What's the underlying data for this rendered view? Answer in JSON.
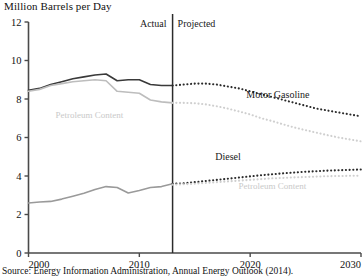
{
  "chart_data": {
    "type": "line",
    "title": "Million Barrels per Day",
    "xlabel": "",
    "ylabel": "Million Barrels per Day",
    "xlim": [
      2000,
      2030
    ],
    "ylim": [
      0,
      12
    ],
    "yticks": [
      0,
      2,
      4,
      6,
      8,
      10,
      12
    ],
    "xticks": [
      2000,
      2010,
      2020,
      2030
    ],
    "grid": false,
    "legend": "inline-annotations",
    "divider_year": 2013,
    "period_labels": {
      "actual": "Actual",
      "projected": "Projected"
    },
    "annotations": [
      {
        "text": "Motor Gasoline",
        "x": 2022.5,
        "y": 8.05,
        "color": "#2b2b2b"
      },
      {
        "text": "Petroleum Content",
        "x": 2005.5,
        "y": 7.0,
        "color": "#c9c9c9"
      },
      {
        "text": "Diesel",
        "x": 2018.0,
        "y": 4.85,
        "color": "#2b2b2b"
      },
      {
        "text": "Petroleum Content",
        "x": 2022.0,
        "y": 3.35,
        "color": "#c9c9c9"
      }
    ],
    "series": [
      {
        "name": "Motor Gasoline",
        "style": "solid",
        "segment": "actual",
        "color": "#3a3a3a",
        "x": [
          2000,
          2001,
          2002,
          2003,
          2004,
          2005,
          2006,
          2007,
          2008,
          2009,
          2010,
          2011,
          2012,
          2013
        ],
        "values": [
          8.45,
          8.55,
          8.75,
          8.9,
          9.05,
          9.15,
          9.25,
          9.3,
          8.95,
          9.0,
          9.0,
          8.75,
          8.7,
          8.7
        ]
      },
      {
        "name": "Motor Gasoline Petroleum Content",
        "style": "solid",
        "segment": "actual",
        "color": "#bdbdbd",
        "x": [
          2000,
          2001,
          2002,
          2003,
          2004,
          2005,
          2006,
          2007,
          2008,
          2009,
          2010,
          2011,
          2012,
          2013
        ],
        "values": [
          8.4,
          8.5,
          8.7,
          8.8,
          8.9,
          8.95,
          9.0,
          8.95,
          8.4,
          8.35,
          8.3,
          7.95,
          7.85,
          7.8
        ]
      },
      {
        "name": "Motor Gasoline",
        "style": "dotted",
        "segment": "projected",
        "color": "#2b2b2b",
        "x": [
          2013,
          2014,
          2015,
          2016,
          2017,
          2018,
          2019,
          2020,
          2021,
          2022,
          2023,
          2024,
          2025,
          2026,
          2027,
          2028,
          2029,
          2030
        ],
        "values": [
          8.7,
          8.75,
          8.8,
          8.8,
          8.75,
          8.65,
          8.55,
          8.4,
          8.25,
          8.1,
          7.95,
          7.8,
          7.65,
          7.5,
          7.4,
          7.3,
          7.2,
          7.1
        ]
      },
      {
        "name": "Motor Gasoline Petroleum Content",
        "style": "dotted",
        "segment": "projected",
        "color": "#cfcfcf",
        "x": [
          2013,
          2014,
          2015,
          2016,
          2017,
          2018,
          2019,
          2020,
          2021,
          2022,
          2023,
          2024,
          2025,
          2026,
          2027,
          2028,
          2029,
          2030
        ],
        "values": [
          7.8,
          7.8,
          7.78,
          7.72,
          7.62,
          7.5,
          7.35,
          7.2,
          7.0,
          6.85,
          6.68,
          6.52,
          6.38,
          6.25,
          6.12,
          6.0,
          5.9,
          5.8
        ]
      },
      {
        "name": "Diesel",
        "style": "solid",
        "segment": "actual",
        "color": "#9a9a9a",
        "x": [
          2000,
          2001,
          2002,
          2003,
          2004,
          2005,
          2006,
          2007,
          2008,
          2009,
          2010,
          2011,
          2012,
          2013
        ],
        "values": [
          2.6,
          2.65,
          2.68,
          2.8,
          2.95,
          3.1,
          3.3,
          3.45,
          3.4,
          3.12,
          3.25,
          3.4,
          3.45,
          3.6
        ]
      },
      {
        "name": "Diesel",
        "style": "dotted",
        "segment": "projected",
        "color": "#2b2b2b",
        "x": [
          2013,
          2014,
          2015,
          2016,
          2017,
          2018,
          2019,
          2020,
          2021,
          2022,
          2023,
          2024,
          2025,
          2026,
          2027,
          2028,
          2029,
          2030
        ],
        "values": [
          3.6,
          3.62,
          3.68,
          3.74,
          3.8,
          3.86,
          3.92,
          3.98,
          4.04,
          4.09,
          4.14,
          4.18,
          4.22,
          4.25,
          4.28,
          4.3,
          4.32,
          4.34
        ]
      },
      {
        "name": "Diesel Petroleum Content",
        "style": "dotted",
        "segment": "projected",
        "color": "#cfcfcf",
        "x": [
          2013,
          2014,
          2015,
          2016,
          2017,
          2018,
          2019,
          2020,
          2021,
          2022,
          2023,
          2024,
          2025,
          2026,
          2027,
          2028,
          2029,
          2030
        ],
        "values": [
          3.55,
          3.57,
          3.6,
          3.64,
          3.68,
          3.72,
          3.76,
          3.8,
          3.84,
          3.88,
          3.9,
          3.93,
          3.95,
          3.97,
          3.99,
          4.0,
          4.01,
          4.02
        ]
      }
    ]
  },
  "source": {
    "text": "Source: Energy Information Administration, Annual Energy Outlook (2014)."
  },
  "colors": {
    "axis": "#4a4a4a",
    "dark_series": "#2b2b2b",
    "light_series": "#c9c9c9",
    "mid_series": "#9a9a9a",
    "text": "#111111"
  }
}
